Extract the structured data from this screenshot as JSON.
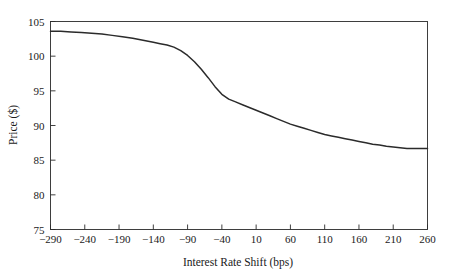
{
  "figure": {
    "background_color": "#ffffff",
    "frame_color": "#2b2b2b",
    "text_color": "#1a1a1a"
  },
  "chart_data": {
    "type": "line",
    "title": "",
    "xlabel": "Interest Rate Shift (bps)",
    "ylabel": "Price ($)",
    "xlim": [
      -290,
      260
    ],
    "ylim": [
      75,
      105
    ],
    "xticks": [
      -290,
      -240,
      -190,
      -140,
      -90,
      -40,
      10,
      60,
      110,
      160,
      210,
      260
    ],
    "yticks": [
      75,
      80,
      85,
      90,
      95,
      100,
      105
    ],
    "xtick_labels": [
      "−290",
      "−240",
      "−190",
      "−140",
      "−90",
      "−40",
      "10",
      "60",
      "110",
      "160",
      "210",
      "260"
    ],
    "ytick_labels": [
      "75",
      "80",
      "85",
      "90",
      "95",
      "100",
      "105"
    ],
    "grid": false,
    "legend": false,
    "series": [
      {
        "name": "Price",
        "color": "#2b2b2b",
        "line_width": 1.5,
        "x": [
          -290,
          -275,
          -260,
          -245,
          -230,
          -215,
          -200,
          -185,
          -170,
          -155,
          -140,
          -130,
          -120,
          -110,
          -100,
          -90,
          -80,
          -70,
          -60,
          -50,
          -40,
          -30,
          -20,
          -10,
          0,
          10,
          20,
          30,
          40,
          50,
          60,
          70,
          80,
          90,
          100,
          110,
          120,
          130,
          140,
          150,
          160,
          170,
          180,
          190,
          200,
          210,
          220,
          230,
          240,
          250,
          260
        ],
        "y": [
          103.6,
          103.6,
          103.5,
          103.4,
          103.3,
          103.2,
          103.0,
          102.8,
          102.6,
          102.3,
          102.0,
          101.8,
          101.6,
          101.3,
          100.8,
          100.1,
          99.2,
          98.1,
          96.9,
          95.6,
          94.5,
          93.8,
          93.4,
          93.0,
          92.6,
          92.2,
          91.8,
          91.4,
          91.0,
          90.6,
          90.2,
          89.9,
          89.6,
          89.3,
          89.0,
          88.7,
          88.5,
          88.3,
          88.1,
          87.9,
          87.7,
          87.5,
          87.3,
          87.2,
          87.0,
          86.9,
          86.8,
          86.7,
          86.7,
          86.7,
          86.7
        ]
      }
    ]
  }
}
